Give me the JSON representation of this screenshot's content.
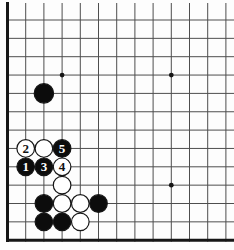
{
  "board": {
    "type": "go-diagram",
    "visible_cols": 13,
    "visible_rows": 13,
    "edges_visible": {
      "left": true,
      "bottom": true,
      "top": false,
      "right": false
    },
    "colors": {
      "background": "#fdfdfd",
      "grid_line": "#4e4e4e",
      "board_edge": "#161616",
      "black_stone": "#0c0c0c",
      "white_stone": "#ffffff",
      "stone_outline": "#161616",
      "label_on_black": "#ffffff",
      "label_on_white": "#111111"
    },
    "star_points": [
      {
        "col": 4,
        "row": 4
      },
      {
        "col": 10,
        "row": 4
      },
      {
        "col": 10,
        "row": 10
      }
    ],
    "stones": [
      {
        "col": 3,
        "row": 5,
        "color": "black",
        "label": "",
        "size": "large"
      },
      {
        "col": 2,
        "row": 8,
        "color": "white",
        "label": "2"
      },
      {
        "col": 3,
        "row": 8,
        "color": "white",
        "label": ""
      },
      {
        "col": 4,
        "row": 8,
        "color": "black",
        "label": "5"
      },
      {
        "col": 2,
        "row": 9,
        "color": "black",
        "label": "1"
      },
      {
        "col": 3,
        "row": 9,
        "color": "black",
        "label": "3"
      },
      {
        "col": 4,
        "row": 9,
        "color": "white",
        "label": "4"
      },
      {
        "col": 4,
        "row": 10,
        "color": "white",
        "label": ""
      },
      {
        "col": 3,
        "row": 11,
        "color": "black",
        "label": ""
      },
      {
        "col": 4,
        "row": 11,
        "color": "white",
        "label": ""
      },
      {
        "col": 5,
        "row": 11,
        "color": "white",
        "label": ""
      },
      {
        "col": 6,
        "row": 11,
        "color": "black",
        "label": ""
      },
      {
        "col": 3,
        "row": 12,
        "color": "black",
        "label": ""
      },
      {
        "col": 4,
        "row": 12,
        "color": "black",
        "label": ""
      },
      {
        "col": 5,
        "row": 12,
        "color": "white",
        "label": ""
      }
    ]
  }
}
